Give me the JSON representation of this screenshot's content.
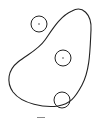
{
  "diagram": {
    "stroke_color": "#222222",
    "background": "#ffffff",
    "region": {
      "shape": "closed-blob",
      "path": "M 72 11 C 82 5, 92 14, 91 30 C 90 50, 90 70, 82 85 C 75 98, 70 104, 58 106 C 45 108, 22 104, 13 92 C 6 82, 8 70, 18 62 C 28 54, 38 50, 45 40 C 52 30, 60 16, 72 11 Z"
    },
    "circles": [
      {
        "id": "circle-1",
        "cx": 39,
        "cy": 24,
        "r": 8,
        "center_dot": true,
        "position": "outside"
      },
      {
        "id": "circle-2",
        "cx": 63,
        "cy": 58,
        "r": 8,
        "center_dot": true,
        "position": "inside"
      },
      {
        "id": "circle-3",
        "cx": 62,
        "cy": 100,
        "r": 8,
        "center_dot": false,
        "position": "on-boundary"
      }
    ],
    "caption": ""
  }
}
